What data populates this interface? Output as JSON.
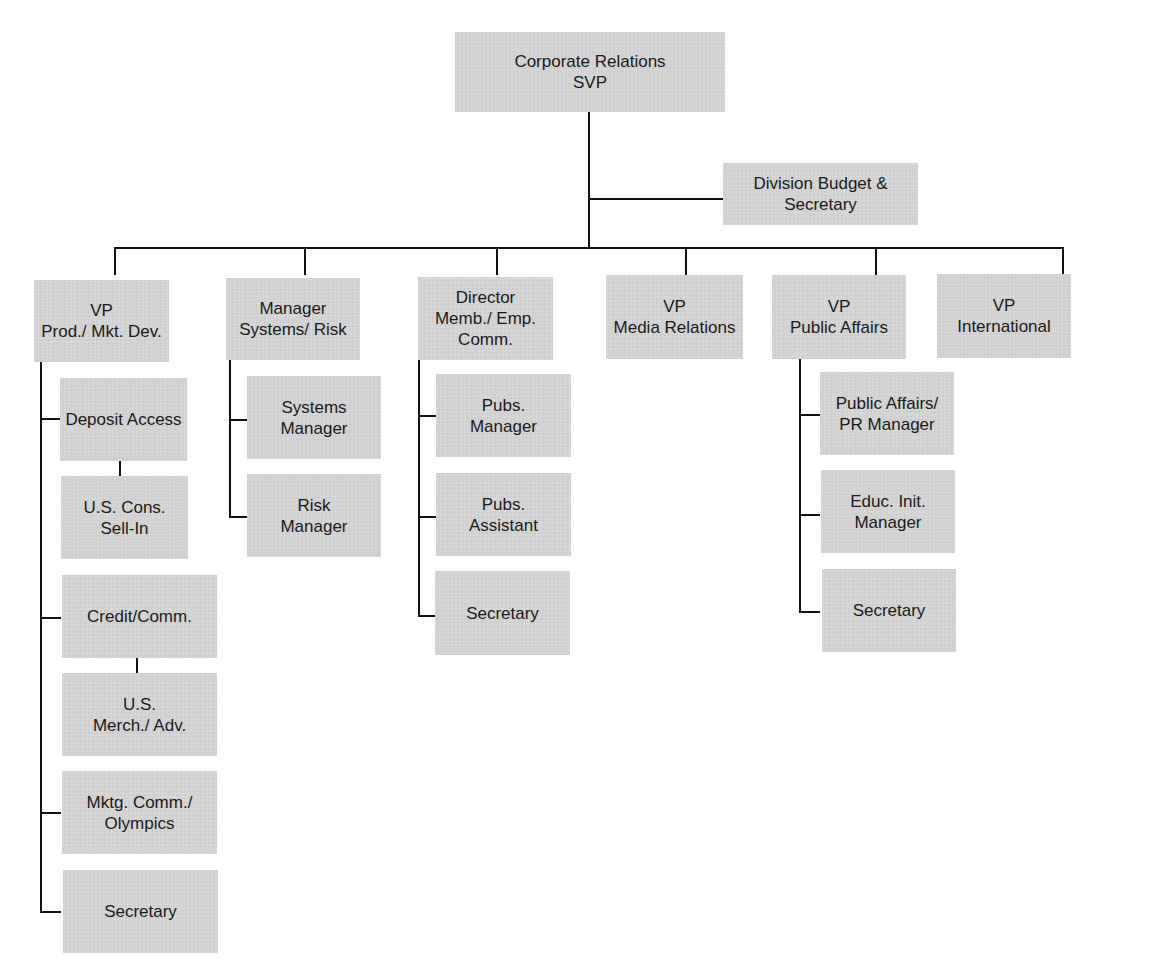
{
  "org_chart": {
    "root": {
      "label": "Corporate Relations\nSVP"
    },
    "staff": {
      "label": "Division Budget &\nSecretary"
    },
    "divisions": [
      {
        "label": "VP\nProd./ Mkt. Dev.",
        "children": [
          {
            "label": "Deposit Access",
            "sub": {
              "label": "U.S. Cons.\nSell-In"
            }
          },
          {
            "label": "Credit/Comm.",
            "sub": {
              "label": "U.S.\nMerch./ Adv."
            }
          },
          {
            "label": "Mktg. Comm./\nOlympics"
          },
          {
            "label": "Secretary"
          }
        ]
      },
      {
        "label": "Manager\nSystems/ Risk",
        "children": [
          {
            "label": "Systems\nManager"
          },
          {
            "label": "Risk\nManager"
          }
        ]
      },
      {
        "label": "Director\nMemb./ Emp.\nComm.",
        "children": [
          {
            "label": "Pubs.\nManager"
          },
          {
            "label": "Pubs.\nAssistant"
          },
          {
            "label": "Secretary"
          }
        ]
      },
      {
        "label": "VP\nMedia Relations",
        "children": []
      },
      {
        "label": "VP\nPublic Affairs",
        "children": [
          {
            "label": "Public Affairs/\nPR Manager"
          },
          {
            "label": "Educ. Init.\nManager"
          },
          {
            "label": "Secretary"
          }
        ]
      },
      {
        "label": "VP\nInternational",
        "children": []
      }
    ]
  },
  "colors": {
    "box_fill": "#d3d3d3",
    "line": "#111111",
    "text": "#1a1a1a"
  }
}
